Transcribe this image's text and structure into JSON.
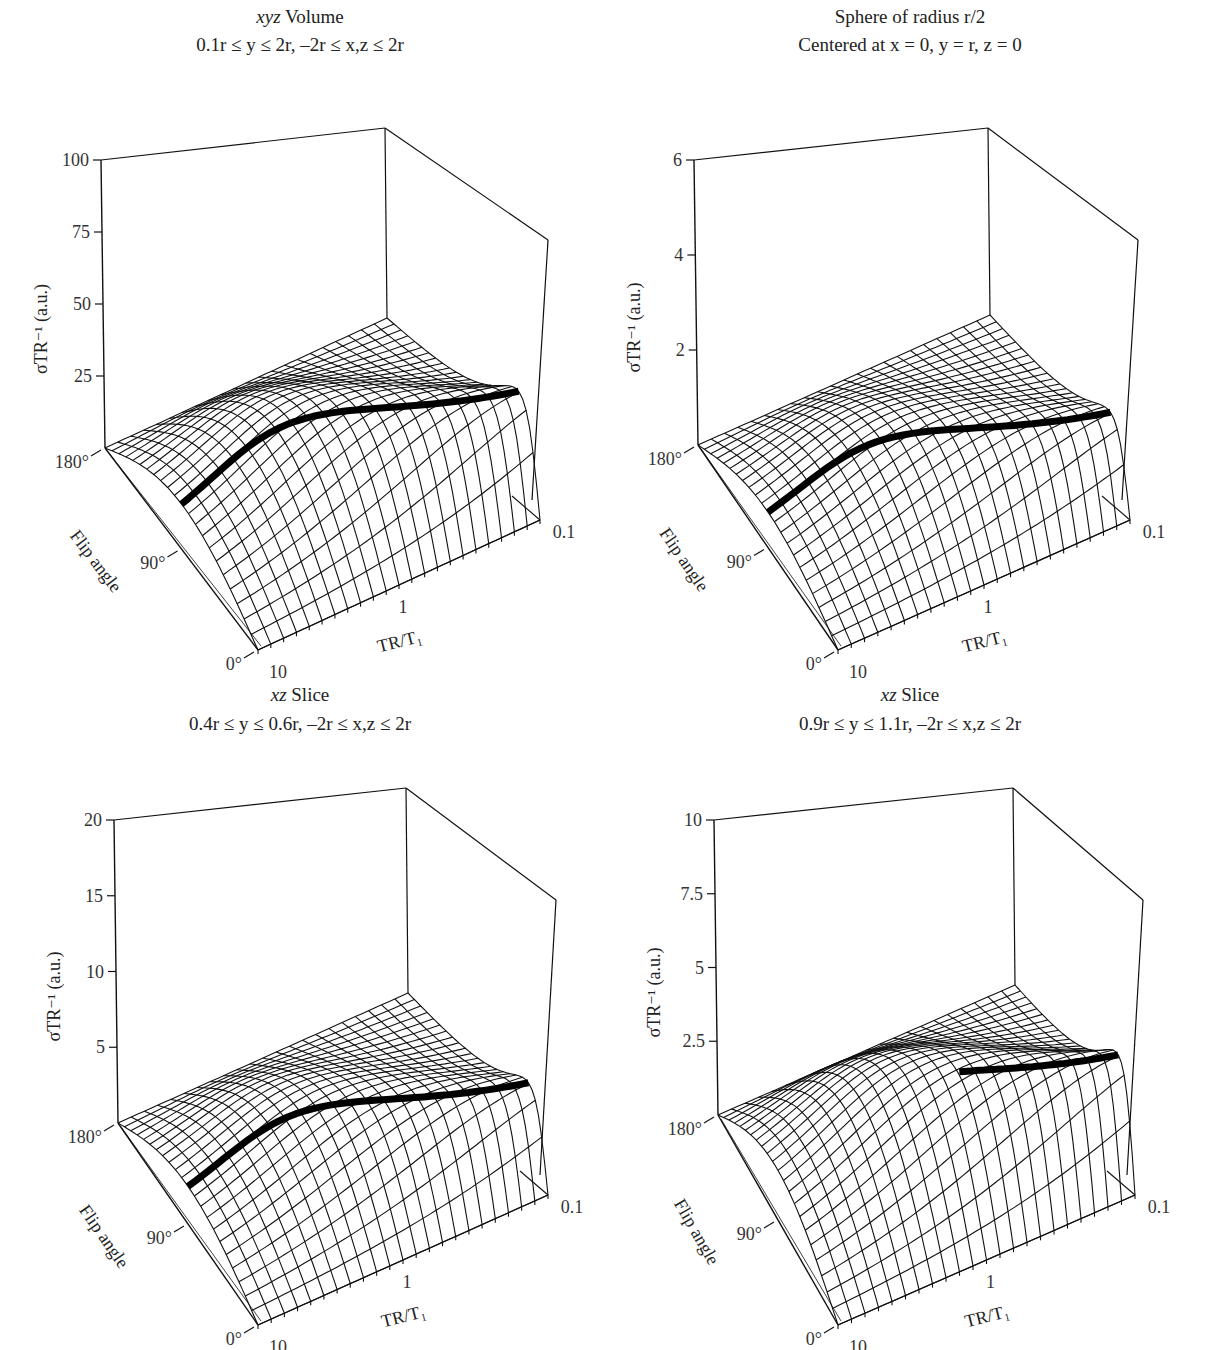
{
  "figure": {
    "panels": [
      {
        "id": "xyz-volume",
        "title_italic": "xyz",
        "title_rest": " Volume",
        "subtitle": "0.1r ≤ y ≤ 2r, –2r ≤ x,z ≤ 2r",
        "z_ticks": [
          "100",
          "75",
          "50",
          "25"
        ],
        "z_axis_label": "σTR⁻¹ (a.u.)",
        "flip_ticks": [
          "180°",
          "90°",
          "0°"
        ],
        "flip_axis_label": "Flip angle",
        "tr_ticks": [
          "10",
          "1",
          "0.1"
        ],
        "tr_axis_label": "TR/T₁"
      },
      {
        "id": "sphere",
        "title_italic": "",
        "title_rest": "Sphere of radius r/2",
        "subtitle": "Centered at x = 0, y = r, z = 0",
        "z_ticks": [
          "6",
          "4",
          "2"
        ],
        "z_axis_label": "σTR⁻¹ (a.u.)",
        "flip_ticks": [
          "180°",
          "90°",
          "0°"
        ],
        "flip_axis_label": "Flip angle",
        "tr_ticks": [
          "10",
          "1",
          "0.1"
        ],
        "tr_axis_label": "TR/T₁"
      },
      {
        "id": "xz-slice-low",
        "title_italic": "xz",
        "title_rest": " Slice",
        "subtitle": "0.4r ≤ y ≤ 0.6r, –2r ≤ x,z ≤ 2r",
        "z_ticks": [
          "20",
          "15",
          "10",
          "5"
        ],
        "z_axis_label": "σTR⁻¹ (a.u.)",
        "flip_ticks": [
          "180°",
          "90°",
          "0°"
        ],
        "flip_axis_label": "Flip angle",
        "tr_ticks": [
          "10",
          "1",
          "0.1"
        ],
        "tr_axis_label": "TR/T₁"
      },
      {
        "id": "xz-slice-mid",
        "title_italic": "xz",
        "title_rest": " Slice",
        "subtitle": "0.9r ≤ y ≤ 1.1r, –2r ≤ x,z ≤ 2r",
        "z_ticks": [
          "10",
          "7.5",
          "5",
          "2.5"
        ],
        "z_axis_label": "σTR⁻¹ (a.u.)",
        "flip_ticks": [
          "180°",
          "90°",
          "0°"
        ],
        "flip_axis_label": "Flip angle",
        "tr_ticks": [
          "10",
          "1",
          "0.1"
        ],
        "tr_axis_label": "TR/T₁"
      }
    ]
  },
  "chart_data": [
    {
      "type": "surface",
      "title": "xyz Volume",
      "subtitle": "0.1r ≤ y ≤ 2r, –2r ≤ x,z ≤ 2r",
      "xlabel": "TR/T₁",
      "x_ticks": [
        "10",
        "1",
        "0.1"
      ],
      "x_scale": "log",
      "xlim": [
        10,
        0.1
      ],
      "ylabel": "Flip angle",
      "y_ticks": [
        "0°",
        "90°",
        "180°"
      ],
      "ylim": [
        0,
        180
      ],
      "zlabel": "σTR⁻¹ (a.u.)",
      "z_ticks": [
        25,
        50,
        75,
        100
      ],
      "zlim": [
        0,
        100
      ],
      "peak_value_approx": 72,
      "peak_location": {
        "TR/T1": 0.1,
        "flip_angle_deg": 50
      },
      "ridge_line": "thick black line marking optimal flip angle at each TR/T₁",
      "grid": "wireframe mesh"
    },
    {
      "type": "surface",
      "title": "Sphere of radius r/2",
      "subtitle": "Centered at x = 0, y = r, z = 0",
      "xlabel": "TR/T₁",
      "x_ticks": [
        "10",
        "1",
        "0.1"
      ],
      "x_scale": "log",
      "xlim": [
        10,
        0.1
      ],
      "ylabel": "Flip angle",
      "y_ticks": [
        "0°",
        "90°",
        "180°"
      ],
      "ylim": [
        0,
        180
      ],
      "zlabel": "σTR⁻¹ (a.u.)",
      "z_ticks": [
        2,
        4,
        6
      ],
      "zlim": [
        0,
        6
      ],
      "peak_value_approx": 4.2,
      "peak_location": {
        "TR/T1": 0.1,
        "flip_angle_deg": 40
      },
      "ridge_line": "thick black line marking optimal flip angle at each TR/T₁",
      "grid": "wireframe mesh"
    },
    {
      "type": "surface",
      "title": "xz Slice",
      "subtitle": "0.4r ≤ y ≤ 0.6r, –2r ≤ x,z ≤ 2r",
      "xlabel": "TR/T₁",
      "x_ticks": [
        "10",
        "1",
        "0.1"
      ],
      "x_scale": "log",
      "xlim": [
        10,
        0.1
      ],
      "ylabel": "Flip angle",
      "y_ticks": [
        "0°",
        "90°",
        "180°"
      ],
      "ylim": [
        0,
        180
      ],
      "zlabel": "σTR⁻¹ (a.u.)",
      "z_ticks": [
        5,
        10,
        15,
        20
      ],
      "zlim": [
        0,
        20
      ],
      "peak_value_approx": 14,
      "peak_location": {
        "TR/T1": 0.1,
        "flip_angle_deg": 45
      },
      "ridge_line": "thick black line marking optimal flip angle at each TR/T₁",
      "grid": "wireframe mesh"
    },
    {
      "type": "surface",
      "title": "xz Slice",
      "subtitle": "0.9r ≤ y ≤ 1.1r, –2r ≤ x,z ≤ 2r",
      "xlabel": "TR/T₁",
      "x_ticks": [
        "10",
        "1",
        "0.1"
      ],
      "x_scale": "log",
      "xlim": [
        10,
        0.1
      ],
      "ylabel": "Flip angle",
      "y_ticks": [
        "0°",
        "90°",
        "180°"
      ],
      "ylim": [
        0,
        180
      ],
      "zlabel": "σTR⁻¹ (a.u.)",
      "z_ticks": [
        2.5,
        5,
        7.5,
        10
      ],
      "zlim": [
        0,
        10
      ],
      "peak_value_approx": 8.5,
      "peak_location": {
        "TR/T1": 0.1,
        "flip_angle_deg": 30
      },
      "ridge_line": "thick black line, visible only for short TR/T₁ (≈0.1 to 0.7)",
      "grid": "wireframe mesh"
    }
  ]
}
